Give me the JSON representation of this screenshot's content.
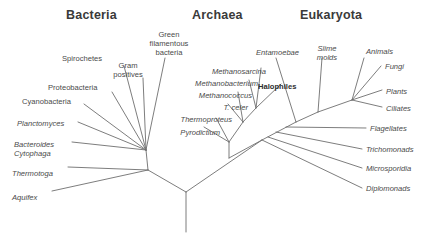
{
  "figure": {
    "background_color": "#ffffff",
    "line_color": "#6e6e6e",
    "text_color": "#4a4a4a"
  },
  "domains": [
    {
      "key": "bacteria",
      "label": "Bacteria",
      "x": 66,
      "y": 8
    },
    {
      "key": "archaea",
      "label": "Archaea",
      "x": 192,
      "y": 8
    },
    {
      "key": "eukaryota",
      "label": "Eukaryota",
      "x": 300,
      "y": 8
    }
  ],
  "taxa": {
    "bacteria": [
      {
        "key": "green-filamentous-bacteria",
        "label": "Green\nfilamentous\nbacteria",
        "style": "plain",
        "x": 140,
        "y": 30,
        "align": "center",
        "width": 58
      },
      {
        "key": "spirochetes",
        "label": "Spirochetes",
        "style": "plain",
        "x": 62,
        "y": 54,
        "align": "left",
        "width": 58
      },
      {
        "key": "gram-positives",
        "label": "Gram\npositives",
        "style": "plain",
        "x": 107,
        "y": 61,
        "align": "center",
        "width": 42
      },
      {
        "key": "proteobacteria",
        "label": "Proteobacteria",
        "style": "plain",
        "x": 48,
        "y": 83,
        "align": "left",
        "width": 68
      },
      {
        "key": "cyanobacteria",
        "label": "Cyanobacteria",
        "style": "plain",
        "x": 22,
        "y": 97,
        "align": "left",
        "width": 66
      },
      {
        "key": "planctomyces",
        "label": "Planctomyces",
        "style": "italic",
        "x": 17,
        "y": 119,
        "align": "left",
        "width": 64
      },
      {
        "key": "bacteroides-cytophaga",
        "label": "Bacteroides\nCytophaga",
        "style": "italic",
        "x": 14,
        "y": 140,
        "align": "left",
        "width": 62
      },
      {
        "key": "thermotoga",
        "label": "Thermotoga",
        "style": "italic",
        "x": 12,
        "y": 169,
        "align": "left",
        "width": 56
      },
      {
        "key": "aquifex",
        "label": "Aquifex",
        "style": "italic",
        "x": 12,
        "y": 193,
        "align": "left",
        "width": 40
      }
    ],
    "archaea": [
      {
        "key": "methanosarcina",
        "label": "Methanosarcina",
        "style": "italic",
        "x": 196,
        "y": 67,
        "align": "right",
        "width": 70
      },
      {
        "key": "methanobacterium",
        "label": "Methanobacterium",
        "style": "italic",
        "x": 172,
        "y": 79,
        "align": "right",
        "width": 86
      },
      {
        "key": "methanococcus",
        "label": "Methanococcus",
        "style": "italic",
        "x": 180,
        "y": 91,
        "align": "right",
        "width": 72
      },
      {
        "key": "t-celer",
        "label": "T. celer",
        "style": "italic",
        "x": 196,
        "y": 103,
        "align": "right",
        "width": 52
      },
      {
        "key": "thermoproteus",
        "label": "Thermoproteus",
        "style": "italic",
        "x": 164,
        "y": 115,
        "align": "right",
        "width": 68
      },
      {
        "key": "pyrodictium",
        "label": "Pyrodictium",
        "style": "italic",
        "x": 158,
        "y": 128,
        "align": "right",
        "width": 62
      },
      {
        "key": "halophiles",
        "label": "Halophiles",
        "style": "bold",
        "x": 258,
        "y": 82,
        "align": "left",
        "width": 52
      }
    ],
    "eukaryota": [
      {
        "key": "entamoebae",
        "label": "Entamoebae",
        "style": "italic",
        "x": 256,
        "y": 48,
        "align": "left",
        "width": 52
      },
      {
        "key": "slime-molds",
        "label": "Slime\nmolds",
        "style": "italic",
        "x": 311,
        "y": 44,
        "align": "center",
        "width": 32
      },
      {
        "key": "animals",
        "label": "Animals",
        "style": "italic",
        "x": 366,
        "y": 47,
        "align": "left",
        "width": 40
      },
      {
        "key": "fungi",
        "label": "Fungi",
        "style": "italic",
        "x": 385,
        "y": 62,
        "align": "left",
        "width": 34
      },
      {
        "key": "plants",
        "label": "Plants",
        "style": "italic",
        "x": 386,
        "y": 87,
        "align": "left",
        "width": 36
      },
      {
        "key": "ciliates",
        "label": "Ciliates",
        "style": "italic",
        "x": 386,
        "y": 104,
        "align": "left",
        "width": 40
      },
      {
        "key": "flagellates",
        "label": "Flagellates",
        "style": "italic",
        "x": 370,
        "y": 124,
        "align": "left",
        "width": 52
      },
      {
        "key": "trichomonads",
        "label": "Trichomonads",
        "style": "italic",
        "x": 366,
        "y": 145,
        "align": "left",
        "width": 58
      },
      {
        "key": "microsporidia",
        "label": "Microsporidia",
        "style": "italic",
        "x": 366,
        "y": 164,
        "align": "left",
        "width": 58
      },
      {
        "key": "diplomonads",
        "label": "Diplomonads",
        "style": "italic",
        "x": 366,
        "y": 184,
        "align": "left",
        "width": 56
      }
    ]
  },
  "tree_edges": {
    "root": [
      {
        "key": "root-trunk",
        "x1": 186,
        "y1": 192,
        "x2": 186,
        "y2": 232
      },
      {
        "key": "root-to-bacteria",
        "x1": 186,
        "y1": 192,
        "x2": 148,
        "y2": 170
      },
      {
        "key": "root-to-archeuk",
        "x1": 186,
        "y1": 192,
        "x2": 262,
        "y2": 140
      }
    ],
    "bacteria": [
      {
        "key": "edge-aquifex",
        "x1": 148,
        "y1": 170,
        "x2": 52,
        "y2": 191
      },
      {
        "key": "edge-thermotoga",
        "x1": 148,
        "y1": 170,
        "x2": 68,
        "y2": 167
      },
      {
        "key": "bacteria-stem",
        "x1": 148,
        "y1": 170,
        "x2": 146,
        "y2": 150
      },
      {
        "key": "edge-bacteroides",
        "x1": 146,
        "y1": 150,
        "x2": 72,
        "y2": 142
      },
      {
        "key": "edge-planctomyces",
        "x1": 146,
        "y1": 150,
        "x2": 78,
        "y2": 122
      },
      {
        "key": "edge-cyanobacteria",
        "x1": 146,
        "y1": 150,
        "x2": 84,
        "y2": 104
      },
      {
        "key": "edge-proteobacteria",
        "x1": 146,
        "y1": 150,
        "x2": 112,
        "y2": 92
      },
      {
        "key": "edge-spirochetes",
        "x1": 146,
        "y1": 150,
        "x2": 124,
        "y2": 66
      },
      {
        "key": "edge-gram-positives",
        "x1": 146,
        "y1": 150,
        "x2": 143,
        "y2": 78
      },
      {
        "key": "edge-green-filamentous",
        "x1": 146,
        "y1": 150,
        "x2": 165,
        "y2": 58
      }
    ],
    "archaea": [
      {
        "key": "archaea-base",
        "x1": 262,
        "y1": 140,
        "x2": 229,
        "y2": 158
      },
      {
        "key": "archaea-stem",
        "x1": 229,
        "y1": 158,
        "x2": 229,
        "y2": 142
      },
      {
        "key": "edge-pyrodictium",
        "x1": 229,
        "y1": 142,
        "x2": 204,
        "y2": 127
      },
      {
        "key": "edge-thermoproteus",
        "x1": 229,
        "y1": 142,
        "x2": 216,
        "y2": 118
      },
      {
        "key": "archaea-upper-stem",
        "x1": 229,
        "y1": 142,
        "x2": 243,
        "y2": 122
      },
      {
        "key": "edge-t-celer",
        "x1": 243,
        "y1": 122,
        "x2": 228,
        "y2": 104
      },
      {
        "key": "edge-methanococcus",
        "x1": 243,
        "y1": 122,
        "x2": 238,
        "y2": 92
      },
      {
        "key": "archaea-crown-stem",
        "x1": 243,
        "y1": 122,
        "x2": 256,
        "y2": 108
      },
      {
        "key": "edge-methanobacterium",
        "x1": 256,
        "y1": 108,
        "x2": 249,
        "y2": 80
      },
      {
        "key": "edge-methanosarcina",
        "x1": 256,
        "y1": 108,
        "x2": 261,
        "y2": 68
      },
      {
        "key": "edge-halophiles",
        "x1": 256,
        "y1": 108,
        "x2": 281,
        "y2": 84
      }
    ],
    "eukaryota": [
      {
        "key": "euk-backbone-1",
        "x1": 262,
        "y1": 140,
        "x2": 296,
        "y2": 122
      },
      {
        "key": "edge-diplomonads",
        "x1": 262,
        "y1": 140,
        "x2": 362,
        "y2": 188
      },
      {
        "key": "edge-microsporidia",
        "x1": 268,
        "y1": 137,
        "x2": 362,
        "y2": 168
      },
      {
        "key": "edge-trichomonads",
        "x1": 276,
        "y1": 132,
        "x2": 362,
        "y2": 149
      },
      {
        "key": "edge-flagellates",
        "x1": 286,
        "y1": 127,
        "x2": 366,
        "y2": 128
      },
      {
        "key": "euk-backbone-2",
        "x1": 296,
        "y1": 122,
        "x2": 318,
        "y2": 112
      },
      {
        "key": "edge-entamoebae",
        "x1": 296,
        "y1": 122,
        "x2": 276,
        "y2": 58
      },
      {
        "key": "edge-slime-molds",
        "x1": 318,
        "y1": 112,
        "x2": 322,
        "y2": 58
      },
      {
        "key": "euk-crown-stem",
        "x1": 318,
        "y1": 112,
        "x2": 352,
        "y2": 100
      },
      {
        "key": "edge-ciliates",
        "x1": 352,
        "y1": 100,
        "x2": 382,
        "y2": 107
      },
      {
        "key": "edge-plants",
        "x1": 352,
        "y1": 100,
        "x2": 382,
        "y2": 90
      },
      {
        "key": "edge-fungi",
        "x1": 352,
        "y1": 100,
        "x2": 381,
        "y2": 66
      },
      {
        "key": "edge-animals",
        "x1": 352,
        "y1": 100,
        "x2": 364,
        "y2": 58
      }
    ]
  }
}
